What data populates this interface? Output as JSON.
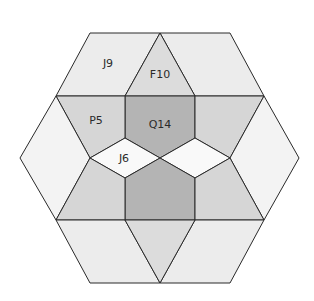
{
  "diagram": {
    "title": "",
    "colors": {
      "light": "#ececec",
      "white": "#f9f9f9",
      "medium": "#d6d6d6",
      "dark": "#b4b4b4",
      "stroke": "#2a2a2a"
    },
    "labels": {
      "j9": "J9",
      "f10": "F10",
      "p5": "P5",
      "q14": "Q14",
      "j6": "J6"
    }
  }
}
